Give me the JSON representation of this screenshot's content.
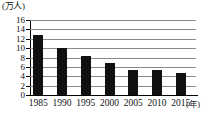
{
  "chart_data": {
    "type": "bar",
    "title": "",
    "xlabel": "(年)",
    "ylabel": "(万人)",
    "categories": [
      "1985",
      "1990",
      "1995",
      "2000",
      "2005",
      "2010",
      "2015"
    ],
    "values": [
      12.7,
      10.0,
      8.3,
      6.8,
      5.4,
      5.3,
      4.6
    ],
    "ylim": [
      0,
      16
    ],
    "ytick_labels": [
      "0",
      "2",
      "4",
      "6",
      "8",
      "10",
      "12",
      "14",
      "16"
    ],
    "ytick_values": [
      0,
      2,
      4,
      6,
      8,
      10,
      12,
      14,
      16
    ],
    "grid": true,
    "legend": false,
    "bar_color": "#111111",
    "grid_color": "#8a8a8a",
    "axis_color": "#000000"
  }
}
